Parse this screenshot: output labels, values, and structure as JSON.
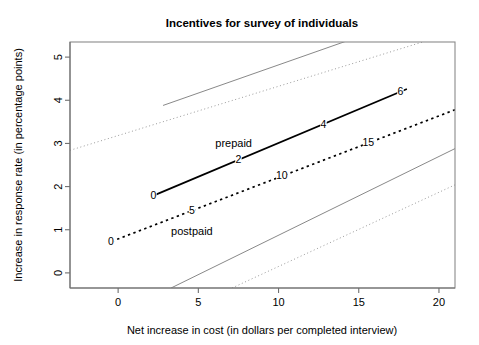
{
  "chart_data": {
    "type": "line",
    "title": "Incentives for survey of individuals",
    "xlabel": "Net increase in cost (in dollars per completed interview)",
    "ylabel": "Increase in response rate (in percentage points)",
    "xlim": [
      -3.0,
      21.0
    ],
    "ylim": [
      -0.35,
      5.35
    ],
    "xticks": [
      0,
      5,
      10,
      15,
      20
    ],
    "xticklabels": [
      "0",
      "5",
      "10",
      "15",
      "20"
    ],
    "yticks": [
      0,
      1,
      2,
      3,
      4,
      5
    ],
    "yticklabels": [
      "0",
      "1",
      "2",
      "3",
      "4",
      "5"
    ],
    "grid": false,
    "legend": "inline-annotations",
    "series": [
      {
        "name": "prepaid",
        "style": "solid",
        "color": "#000000",
        "label_text": "prepaid",
        "label_x": 7.2,
        "label_y": 3.0,
        "x": [
          2.2,
          18.0
        ],
        "y": [
          1.79,
          4.26
        ],
        "points": [
          {
            "label": "0",
            "x": 2.2,
            "y": 1.79
          },
          {
            "label": "2",
            "x": 7.5,
            "y": 2.62
          },
          {
            "label": "4",
            "x": 12.8,
            "y": 3.45
          },
          {
            "label": "6",
            "x": 17.6,
            "y": 4.2
          }
        ]
      },
      {
        "name": "postpaid",
        "style": "dashed",
        "color": "#000000",
        "label_text": "postpaid",
        "label_x": 4.6,
        "label_y": 0.96,
        "x": [
          -0.4,
          21.0
        ],
        "y": [
          0.73,
          3.78
        ],
        "points": [
          {
            "label": "0",
            "x": -0.45,
            "y": 0.72
          },
          {
            "label": "5",
            "x": 4.6,
            "y": 1.44
          },
          {
            "label": "10",
            "x": 10.2,
            "y": 2.25
          },
          {
            "label": "15",
            "x": 15.6,
            "y": 3.02
          }
        ]
      },
      {
        "name": "prepaid-upper-bound",
        "style": "thin-solid",
        "color": "#7a7a7a",
        "x": [
          2.8,
          14.6
        ],
        "y": [
          3.88,
          5.42
        ]
      },
      {
        "name": "prepaid-lower-bound",
        "style": "thin-solid",
        "color": "#7a7a7a",
        "x": [
          3.3,
          21.0
        ],
        "y": [
          -0.35,
          2.88
        ]
      },
      {
        "name": "postpaid-upper-bound",
        "style": "thin-dotted",
        "color": "#8e8e8e",
        "x": [
          -3.0,
          19.6
        ],
        "y": [
          2.84,
          5.42
        ]
      },
      {
        "name": "postpaid-lower-bound",
        "style": "thin-dotted",
        "color": "#8e8e8e",
        "x": [
          7.1,
          21.0
        ],
        "y": [
          -0.35,
          2.04
        ]
      }
    ]
  }
}
